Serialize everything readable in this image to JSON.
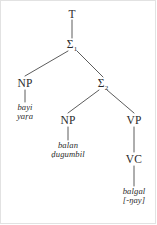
{
  "diagram": {
    "type": "syntax-tree",
    "language_note": "",
    "line_color": "#4a4a4a",
    "text_color": "#2b2b2b",
    "background": "#ffffff"
  },
  "nodes": {
    "root": {
      "label": "T",
      "sub": ""
    },
    "sigma1": {
      "label": "Σ",
      "sub": "1"
    },
    "np1": {
      "label": "NP",
      "sub": ""
    },
    "sigma2": {
      "label": "Σ",
      "sub": "2"
    },
    "np2": {
      "label": "NP",
      "sub": ""
    },
    "vp": {
      "label": "VP",
      "sub": ""
    },
    "vc": {
      "label": "VC",
      "sub": ""
    }
  },
  "terminals": {
    "np1_words": {
      "line1": "bayi",
      "line2": "yaṛa"
    },
    "np2_words": {
      "line1": "balan",
      "line2": "ḍugumbil"
    },
    "vc_words": {
      "line1": "balgal",
      "line2": "[-ŋay]"
    }
  },
  "edges": [
    {
      "from": "root",
      "to": "sigma1"
    },
    {
      "from": "sigma1",
      "to": "np1"
    },
    {
      "from": "sigma1",
      "to": "sigma2"
    },
    {
      "from": "np1",
      "to": "np1_words"
    },
    {
      "from": "sigma2",
      "to": "np2"
    },
    {
      "from": "sigma2",
      "to": "vp"
    },
    {
      "from": "np2",
      "to": "np2_words"
    },
    {
      "from": "vp",
      "to": "vc"
    },
    {
      "from": "vc",
      "to": "vc_words"
    }
  ]
}
